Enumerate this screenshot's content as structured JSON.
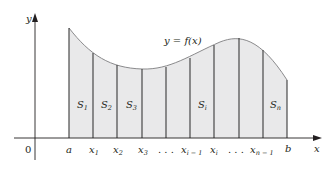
{
  "figure": {
    "curve_label": "y = f(x)",
    "axis_labels": {
      "x": "x",
      "y": "y",
      "origin": "0"
    },
    "ticks": [
      {
        "id": "a",
        "label": "a",
        "sub": ""
      },
      {
        "id": "x1",
        "label": "x",
        "sub": "1"
      },
      {
        "id": "x2",
        "label": "x",
        "sub": "2"
      },
      {
        "id": "x3",
        "label": "x",
        "sub": "3"
      },
      {
        "id": "dots1",
        "label": ". . .",
        "sub": ""
      },
      {
        "id": "xim1",
        "label": "x",
        "sub": "i − 1"
      },
      {
        "id": "xi",
        "label": "x",
        "sub": "i"
      },
      {
        "id": "dots2",
        "label": ". . .",
        "sub": ""
      },
      {
        "id": "xnm1",
        "label": "x",
        "sub": "n − 1"
      },
      {
        "id": "b",
        "label": "b",
        "sub": ""
      }
    ],
    "strip_labels": [
      {
        "label": "S",
        "sub": "1"
      },
      {
        "label": "S",
        "sub": "2"
      },
      {
        "label": "S",
        "sub": "3"
      },
      {
        "label": "S",
        "sub": "i"
      },
      {
        "label": "S",
        "sub": "n"
      }
    ],
    "colors": {
      "fill": "#e9e9ea",
      "curve": "#8a8a8c",
      "lines": "#3a3a3a",
      "axis": "#231f20"
    }
  }
}
